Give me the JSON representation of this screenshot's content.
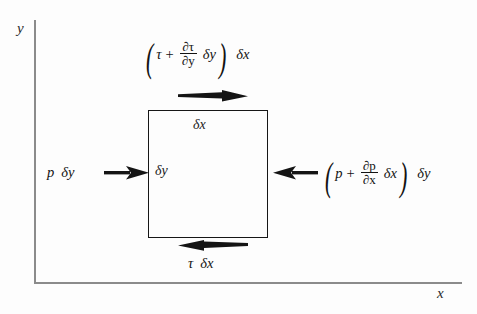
{
  "figure": {
    "background_color": "#fdfdfd",
    "axes": {
      "x_label": "x",
      "y_label": "y",
      "line_color": "#8b8b8b"
    },
    "element": {
      "border_color": "#161616",
      "width_label": "δx",
      "height_label": "δy"
    },
    "labels": {
      "top": {
        "full": "(τ + ∂τ/∂y δy) δx",
        "open_paren": "(",
        "base": "τ",
        "plus": "+",
        "frac_num": "∂τ",
        "frac_den": "∂y",
        "delta": "δy",
        "close_paren": ")",
        "suffix": "δx"
      },
      "bottom": {
        "full": "τ δx",
        "base": "τ",
        "suffix": "δx"
      },
      "left": {
        "full": "p δy",
        "base": "p",
        "suffix": "δy"
      },
      "right": {
        "full": "(p + ∂p/∂x δx) δy",
        "open_paren": "(",
        "base": "p",
        "plus": "+",
        "frac_num": "∂p",
        "frac_den": "∂x",
        "delta": "δx",
        "close_paren": ")",
        "suffix": "δy"
      }
    },
    "arrows": {
      "top": "shear-arrow-right",
      "bottom": "shear-arrow-left",
      "left": "pressure-arrow-right",
      "right": "pressure-arrow-left"
    }
  }
}
